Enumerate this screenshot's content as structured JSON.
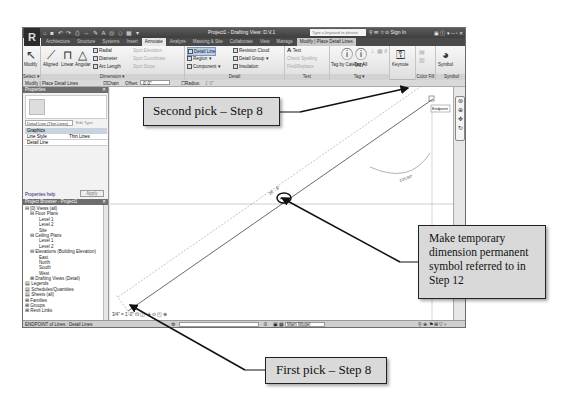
{
  "app": {
    "title": "Project1 - Drafting View: D.V.1",
    "search_placeholder": "Type a keyword or phrase",
    "sign_in": "Sign In",
    "menu_button": "R",
    "quick_access": "⌂ ■ ↶ ↷ ⎙ ↔ ✎ A ◎ ◇ ▦ ▾"
  },
  "tabs": [
    {
      "label": "Architecture",
      "active": false
    },
    {
      "label": "Structure",
      "active": false
    },
    {
      "label": "Systems",
      "active": false
    },
    {
      "label": "Insert",
      "active": false
    },
    {
      "label": "Annotate",
      "active": true
    },
    {
      "label": "Analyze",
      "active": false
    },
    {
      "label": "Massing & Site",
      "active": false
    },
    {
      "label": "Collaborate",
      "active": false
    },
    {
      "label": "View",
      "active": false
    },
    {
      "label": "Manage",
      "active": false
    },
    {
      "label": "Modify | Place Detail Lines",
      "active": false,
      "contextual": true
    }
  ],
  "ribbon": {
    "select": {
      "modify": "Modify",
      "panel": "Select ▾"
    },
    "dimension": {
      "aligned": "Aligned",
      "linear": "Linear",
      "angular": "Angular",
      "radial": "Radial",
      "diameter": "Diameter",
      "arc_length": "Arc Length",
      "spot_elevation": "Spot Elevation",
      "spot_coordinate": "Spot Coordinate",
      "spot_slope": "Spot Slope",
      "panel": "Dimension ▾"
    },
    "detail": {
      "detail_line": "Detail Line",
      "region": "Region ▾",
      "component": "Component ▾",
      "revision_cloud": "Revision Cloud",
      "detail_group": "Detail Group ▾",
      "insulation": "Insulation",
      "panel": "Detail"
    },
    "text": {
      "text": "Text",
      "check_spelling": "Check Spelling",
      "find_replace": "Find/Replace",
      "panel": "Text"
    },
    "tag": {
      "tag_by_category": "Tag by Category",
      "tag_all": "Tag All",
      "panel": "Tag ▾"
    },
    "keynote": {
      "label": "Keynote"
    },
    "color_fill": {
      "panel": "Color Fill"
    },
    "symbol": {
      "label": "Symbol",
      "panel": "Symbol"
    }
  },
  "options_bar": {
    "context": "Modify | Place Detail Lines",
    "chain_label": "Chain",
    "offset_label": "Offset:",
    "offset_value": "0' 0\"",
    "radius_label": "Radius:",
    "radius_value": "1' 0\""
  },
  "properties": {
    "title": "Properties",
    "type": "Detail Line (Thin Lines)",
    "edit_type": "Edit Type",
    "group": "Graphics",
    "rows": [
      {
        "name": "Line Style",
        "value": "Thin Lines"
      },
      {
        "name": "Detail Line",
        "value": ""
      }
    ],
    "help": "Properties help",
    "apply": "Apply"
  },
  "project_browser": {
    "title": "Project Browser - Project1",
    "items": [
      {
        "label": "⊟ [0] Views (all)",
        "indent": 0
      },
      {
        "label": "⊟ Floor Plans",
        "indent": 1
      },
      {
        "label": "Level 1",
        "indent": 3
      },
      {
        "label": "Level 2",
        "indent": 3
      },
      {
        "label": "Site",
        "indent": 3
      },
      {
        "label": "⊟ Ceiling Plans",
        "indent": 1
      },
      {
        "label": "Level 1",
        "indent": 3
      },
      {
        "label": "Level 2",
        "indent": 3
      },
      {
        "label": "⊟ Elevations (Building Elevation)",
        "indent": 1
      },
      {
        "label": "East",
        "indent": 3
      },
      {
        "label": "North",
        "indent": 3
      },
      {
        "label": "South",
        "indent": 3
      },
      {
        "label": "West",
        "indent": 3
      },
      {
        "label": "⊞ Drafting Views (Detail)",
        "indent": 1
      },
      {
        "label": "▤ Legends",
        "indent": 0
      },
      {
        "label": "▤ Schedules/Quantities",
        "indent": 0
      },
      {
        "label": "▤ Sheets (all)",
        "indent": 0
      },
      {
        "label": "⊞ Families",
        "indent": 0
      },
      {
        "label": "⊞ Groups",
        "indent": 0
      },
      {
        "label": "⊞ Revit Links",
        "indent": 0
      }
    ]
  },
  "canvas": {
    "temp_dimension": "26' - 8\"",
    "dimension_symbol": "⊢⊣",
    "arc_label": "135.00°",
    "snap_tooltip": "Endpoint",
    "scale": "3/4\" = 1'-0\"",
    "view_controls": "⊡ ◫ ☀ ⊙ ◰ ⊕"
  },
  "status_bar": {
    "message": "ENDPOINT of Lines : Detail Lines",
    "model_label": "Main Model",
    "zero": ":0",
    "right_icons": "⚲ ⊕ ⚑ ⊞ ▽ ⌖"
  },
  "callouts": {
    "second_pick": "Second pick – Step 8",
    "make_permanent": "Make temporary dimension permanent symbol referred to in Step 12",
    "first_pick": "First pick – Step 8"
  },
  "colors": {
    "callout_fill": "#d9d9d9",
    "titlebar": "#4a4a4a",
    "canvas": "#ffffff"
  }
}
